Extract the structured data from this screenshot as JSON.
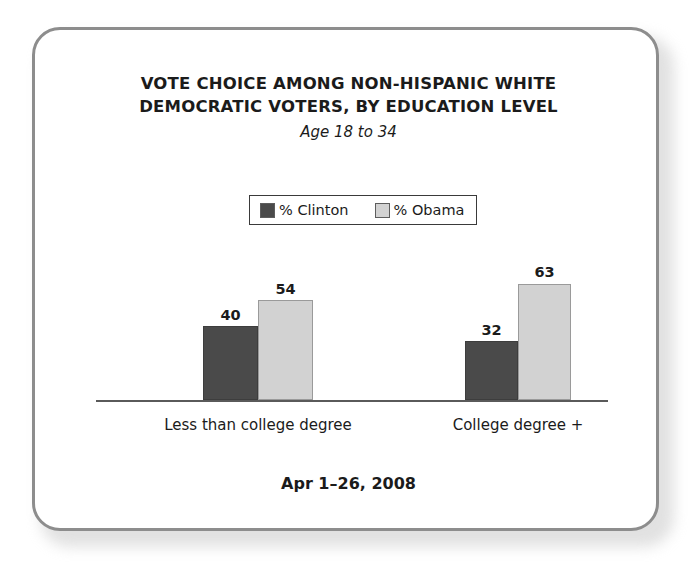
{
  "chart_data": {
    "type": "bar",
    "title": "VOTE CHOICE AMONG NON-HISPANIC WHITE DEMOCRATIC VOTERS, BY EDUCATION LEVEL",
    "title_lines": [
      "VOTE CHOICE AMONG NON-HISPANIC WHITE",
      "DEMOCRATIC VOTERS, BY EDUCATION LEVEL"
    ],
    "subtitle": "Age 18 to 34",
    "categories": [
      "Less than college degree",
      "College degree +"
    ],
    "series": [
      {
        "name": "% Clinton",
        "values": [
          40,
          32
        ],
        "color": "#4a4a4a"
      },
      {
        "name": "% Obama",
        "values": [
          54,
          63
        ],
        "color": "#d2d2d2"
      }
    ],
    "xlabel": "",
    "ylabel": "",
    "ylim": [
      0,
      100
    ],
    "grid": false,
    "legend_position": "top-center",
    "value_labels": true,
    "annotation": "Apr 1–26, 2008"
  },
  "legend": {
    "items": [
      {
        "label": "% Clinton",
        "swatch": "clinton-swatch"
      },
      {
        "label": "% Obama",
        "swatch": "obama-swatch"
      }
    ]
  },
  "footer": {
    "date": "Apr 1–26, 2008"
  },
  "colors": {
    "clinton": "#4a4a4a",
    "obama": "#d2d2d2",
    "frame_border": "#8d8d8d",
    "axis": "#5a5a5a",
    "text": "#1b1b1b"
  }
}
